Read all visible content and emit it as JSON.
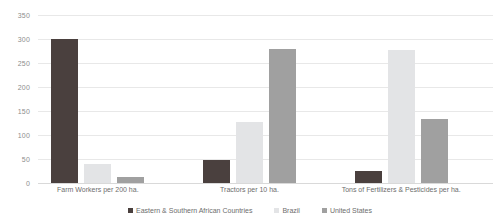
{
  "chart_data": {
    "type": "bar",
    "title": "",
    "xlabel": "",
    "ylabel": "",
    "ylim": [
      0,
      350
    ],
    "yticks": [
      0,
      50,
      100,
      150,
      200,
      250,
      300,
      350
    ],
    "grid": true,
    "legend_position": "bottom",
    "categories": [
      "Farm Workers per 200 ha.",
      "Tractors per 10 ha.",
      "Tons of Fertilizers & Pesticides per ha."
    ],
    "series": [
      {
        "name": "Eastern & Southern African Countries",
        "color": "#4a403e",
        "values": [
          300,
          48,
          25
        ]
      },
      {
        "name": "Brazil",
        "color": "#e3e4e6",
        "values": [
          40,
          128,
          278
        ]
      },
      {
        "name": "United States",
        "color": "#a0a0a0",
        "values": [
          12,
          280,
          133
        ]
      }
    ]
  },
  "axis": {
    "y_tick_labels": [
      "0",
      "50",
      "100",
      "150",
      "200",
      "250",
      "300",
      "350"
    ]
  }
}
